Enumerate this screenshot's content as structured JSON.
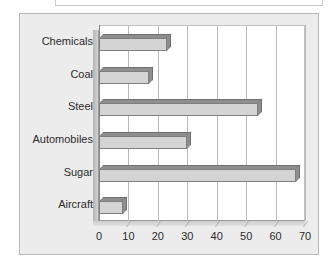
{
  "panel": {
    "background_color": "#ececec",
    "border_color": "#b8b8b8",
    "plot_background_color": "#ffffff"
  },
  "chart_data": {
    "type": "bar",
    "orientation": "horizontal",
    "title": "",
    "subtitle": "",
    "xlabel": "",
    "ylabel": "",
    "categories": [
      "Chemicals",
      "Coal",
      "Steel",
      "Automobiles",
      "Sugar",
      "Aircraft"
    ],
    "values": [
      23,
      17,
      54,
      30,
      67,
      8
    ],
    "xlim": [
      0,
      70
    ],
    "xticks": [
      0,
      10,
      20,
      30,
      40,
      50,
      60,
      70
    ],
    "xtick_labels": [
      "0",
      "10",
      "20",
      "30",
      "40",
      "50",
      "60",
      "70"
    ],
    "grid": true,
    "grid_axis": "x",
    "legend": false,
    "legend_position": "none",
    "style_3d": true,
    "bar_face_color": "#d4d4d4",
    "bar_shade_color": "#8e8e8e",
    "bar_outline_color": "#7f7f7f",
    "gridline_color": "#b9b9b9",
    "axis_color": "#8a8a8a"
  }
}
